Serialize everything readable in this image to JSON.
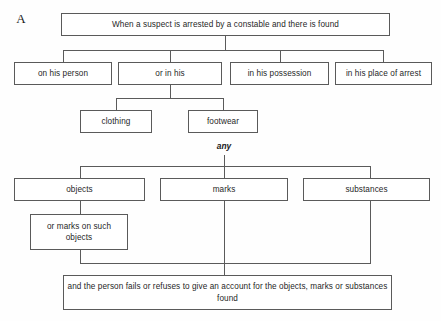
{
  "diagram": {
    "panel_letter": "A",
    "connector_color": "#5a5a5a",
    "box_border_color": "#5a5a5a",
    "background_color": "#fefefe",
    "text_color": "#1f1f1f"
  },
  "nodes": {
    "root": "When a suspect is arrested by a constable and there is found",
    "on_his_person": "on his person",
    "or_in_his": "or in his",
    "in_his_possession": "in his possession",
    "in_his_place_of_arrest": "in his place of arrest",
    "clothing": "clothing",
    "footwear": "footwear",
    "any": "any",
    "objects": "objects",
    "marks": "marks",
    "substances": "substances",
    "or_marks_on_such_objects": "or marks on such objects",
    "conclusion": "and the person fails or refuses to give an account for the objects, marks or substances found"
  }
}
